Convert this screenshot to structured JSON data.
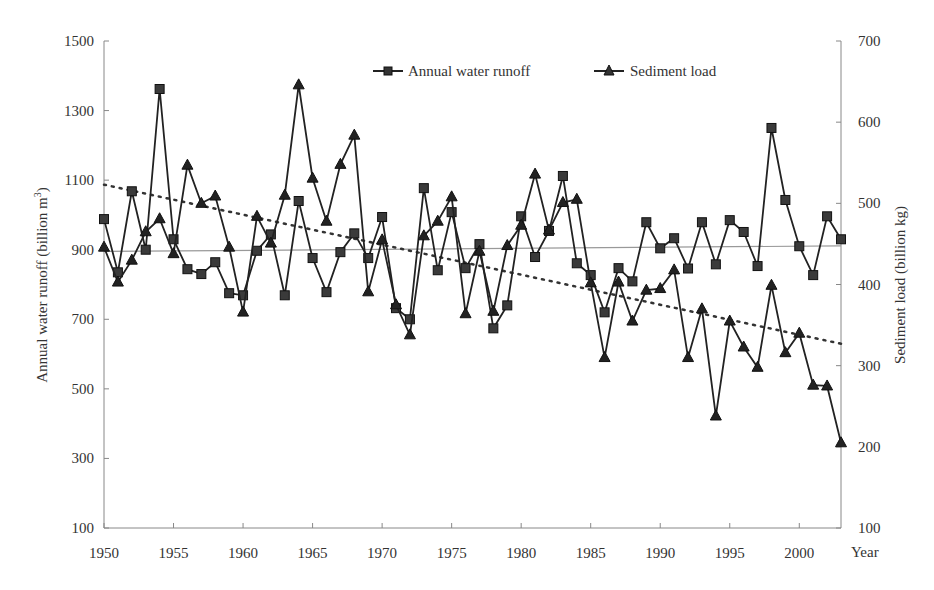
{
  "chart_data": {
    "type": "line",
    "title": "",
    "xlabel": "Year",
    "ylabel_left": "Annual water runoff (billion m³)",
    "ylabel_right": "Sediment load (billion kg)",
    "x_ticks": [
      1950,
      1955,
      1960,
      1965,
      1970,
      1975,
      1980,
      1985,
      1990,
      1995,
      2000
    ],
    "ylim_left": [
      100,
      1500
    ],
    "yticks_left": [
      100,
      300,
      500,
      700,
      900,
      1100,
      1300,
      1500
    ],
    "ylim_right": [
      100,
      700
    ],
    "yticks_right": [
      100,
      200,
      300,
      400,
      500,
      600,
      700
    ],
    "xlim": [
      1950,
      2003
    ],
    "grid": false,
    "legend_position": "top-center",
    "x": [
      1950,
      1951,
      1952,
      1953,
      1954,
      1955,
      1956,
      1957,
      1958,
      1959,
      1960,
      1961,
      1962,
      1963,
      1964,
      1965,
      1966,
      1967,
      1968,
      1969,
      1970,
      1971,
      1972,
      1973,
      1974,
      1975,
      1976,
      1977,
      1978,
      1979,
      1980,
      1981,
      1982,
      1983,
      1984,
      1985,
      1986,
      1987,
      1988,
      1989,
      1990,
      1991,
      1992,
      1993,
      1994,
      1995,
      1996,
      1997,
      1998,
      1999,
      2000,
      2001,
      2002,
      2003
    ],
    "series": [
      {
        "name": "Annual water runoff",
        "axis": "left",
        "marker": "square",
        "values": [
          988,
          835,
          1068,
          900,
          1362,
          930,
          844,
          830,
          864,
          775,
          769,
          897,
          944,
          769,
          1040,
          876,
          778,
          893,
          947,
          876,
          994,
          732,
          700,
          1077,
          841,
          1008,
          847,
          916,
          674,
          740,
          996,
          879,
          954,
          1112,
          861,
          827,
          720,
          847,
          809,
          979,
          904,
          933,
          846,
          979,
          858,
          985,
          951,
          853,
          1250,
          1043,
          910,
          827,
          996,
          930
        ]
      },
      {
        "name": "Sediment load",
        "axis": "right",
        "marker": "triangle",
        "values": [
          446,
          403,
          430,
          465,
          481,
          438,
          547,
          500,
          509,
          446,
          366,
          484,
          451,
          510,
          646,
          531,
          478,
          548,
          584,
          391,
          455,
          375,
          338,
          460,
          478,
          508,
          364,
          441,
          367,
          448,
          473,
          536,
          467,
          501,
          505,
          402,
          310,
          403,
          355,
          393,
          395,
          418,
          310,
          370,
          238,
          355,
          323,
          298,
          399,
          316,
          340,
          276,
          275,
          205
        ]
      }
    ],
    "trendlines": [
      {
        "name": "Runoff linear trend",
        "axis": "left",
        "style": "solid",
        "start": [
          1950,
          895
        ],
        "end": [
          2003,
          911
        ]
      },
      {
        "name": "Sediment linear trend",
        "axis": "right",
        "style": "dotted",
        "start": [
          1950,
          523
        ],
        "end": [
          2003,
          327
        ]
      }
    ]
  },
  "labels": {
    "xlabel": "Year",
    "ylabel_left_main": "Annual water runoff (billion m",
    "ylabel_left_sup": "3",
    "ylabel_left_close": ")",
    "ylabel_right": "Sediment load (billion kg)",
    "legend_runoff": "Annual water runoff",
    "legend_sediment": "Sediment load"
  }
}
